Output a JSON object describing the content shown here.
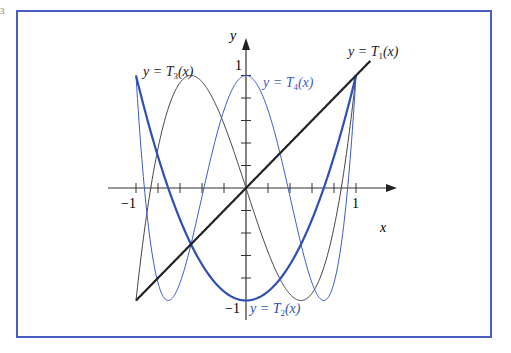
{
  "figure": {
    "corner_mark": "3",
    "frame_color": "#4a5fc1"
  },
  "chart_data": {
    "type": "line",
    "title": "",
    "xlabel": "x",
    "ylabel": "y",
    "xlim": [
      -1.25,
      1.5
    ],
    "ylim": [
      -1.1,
      1.15
    ],
    "x_ticks": [
      -1,
      -0.8,
      -0.6,
      -0.4,
      -0.2,
      0,
      0.2,
      0.4,
      0.6,
      0.8,
      1
    ],
    "y_ticks": [
      -1,
      -0.8,
      -0.6,
      -0.4,
      -0.2,
      0,
      0.2,
      0.4,
      0.6,
      0.8,
      1
    ],
    "x_tick_labels": {
      "-1": "−1",
      "1": "1"
    },
    "y_tick_labels": {
      "-1": "−1",
      "1": "1"
    },
    "grid": false,
    "series": [
      {
        "name": "y = T1(x)",
        "formula": "x",
        "domain": [
          -1,
          1.13
        ],
        "color": "#222222",
        "width": 2.2
      },
      {
        "name": "y = T2(x)",
        "formula": "2x^2 - 1",
        "domain": [
          -1,
          1
        ],
        "color": "#2f4fb5",
        "width": 2.2
      },
      {
        "name": "y = T3(x)",
        "formula": "4x^3 - 3x",
        "domain": [
          -1,
          1
        ],
        "color": "#444444",
        "width": 1
      },
      {
        "name": "y = T4(x)",
        "formula": "8x^4 - 8x^2 + 1",
        "domain": [
          -1,
          1
        ],
        "color": "#3a5bc7",
        "width": 1
      }
    ],
    "annotations": [
      {
        "text": "y = T₁(x)",
        "series": "T1"
      },
      {
        "text": "y = T₂(x)",
        "series": "T2"
      },
      {
        "text": "y = T₃(x)",
        "series": "T3"
      },
      {
        "text": "y = T₄(x)",
        "series": "T4"
      }
    ]
  },
  "labels": {
    "x_axis": "x",
    "y_axis": "y",
    "x_neg1": "−1",
    "x_pos1": "1",
    "y_pos1": "1",
    "y_neg1": "−1",
    "t1_pre": "y = T",
    "t1_sub": "1",
    "t2_pre": "y = T",
    "t2_sub": "2",
    "t3_pre": "y = T",
    "t3_sub": "3",
    "t4_pre": "y = T",
    "t4_sub": "4",
    "suffix": "(x)"
  }
}
